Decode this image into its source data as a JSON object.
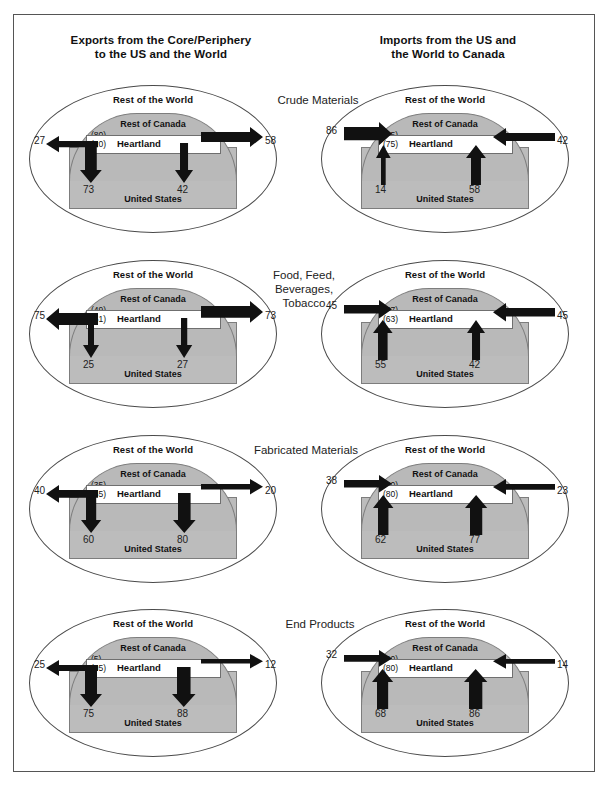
{
  "figure": {
    "column_titles": {
      "left": "Exports from the Core/Periphery to the US and the World",
      "left_line1": "Exports from the Core/Periphery",
      "left_line2": "to the US and the World",
      "right_line1": "Imports from the US and",
      "right_line2": "the World to Canada"
    },
    "region_labels": {
      "world": "Rest of the World",
      "canada": "Rest of Canada",
      "us": "United States",
      "heartland": "Heartland"
    },
    "colors": {
      "canada_fill": "#b9b9b9",
      "us_fill": "#bcbcbc",
      "heartland_fill": "#ffffff",
      "arrow": "#111111",
      "outline": "#4a4a4a",
      "frame": "#555555"
    }
  },
  "chart_data": {
    "type": "diagram",
    "categories": [
      "Crude Materials",
      "Food, Feed, Beverages, Tobacco",
      "Fabricated Materials",
      "End Products"
    ],
    "panels": [
      {
        "category": "Crude Materials",
        "category_line1": "Crude Materials",
        "category_line2": "",
        "exports": {
          "direction": "outward",
          "canada_share": "(80)",
          "heartland_share": "(20)",
          "left_value": "27",
          "right_value": "58",
          "down_left_value": "73",
          "down_right_value": "42"
        },
        "imports": {
          "direction": "inward",
          "canada_share": "(25)",
          "heartland_share": "(75)",
          "left_value": "86",
          "right_value": "42",
          "up_left_value": "14",
          "up_right_value": "58"
        }
      },
      {
        "category": "Food, Feed, Beverages, Tobacco",
        "category_line1": "Food, Feed, Beverages,",
        "category_line2": "Tobacco",
        "exports": {
          "direction": "outward",
          "canada_share": "(49)",
          "heartland_share": "(51)",
          "left_value": "75",
          "right_value": "73",
          "down_left_value": "25",
          "down_right_value": "27"
        },
        "imports": {
          "direction": "inward",
          "canada_share": "(37)",
          "heartland_share": "(63)",
          "left_value": "45",
          "right_value": "45",
          "up_left_value": "55",
          "up_right_value": "42"
        }
      },
      {
        "category": "Fabricated Materials",
        "category_line1": "Fabricated Materials",
        "category_line2": "",
        "exports": {
          "direction": "outward",
          "canada_share": "(35)",
          "heartland_share": "(65)",
          "left_value": "40",
          "right_value": "20",
          "down_left_value": "60",
          "down_right_value": "80"
        },
        "imports": {
          "direction": "inward",
          "canada_share": "(20)",
          "heartland_share": "(80)",
          "left_value": "38",
          "right_value": "23",
          "up_left_value": "62",
          "up_right_value": "77"
        }
      },
      {
        "category": "End Products",
        "category_line1": "End Products",
        "category_line2": "",
        "exports": {
          "direction": "outward",
          "canada_share": "(5)",
          "heartland_share": "(95)",
          "left_value": "25",
          "right_value": "12",
          "down_left_value": "75",
          "down_right_value": "88"
        },
        "imports": {
          "direction": "inward",
          "canada_share": "(20)",
          "heartland_share": "(80)",
          "left_value": "32",
          "right_value": "14",
          "up_left_value": "68",
          "up_right_value": "86"
        }
      }
    ]
  }
}
